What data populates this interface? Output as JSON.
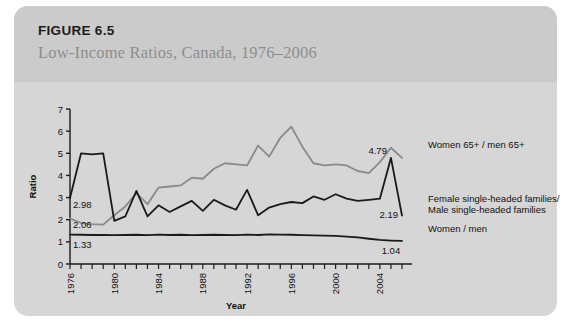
{
  "figure": {
    "number": "FIGURE 6.5",
    "subtitle": "Low-Income Ratios, Canada, 1976–2006"
  },
  "legend": {
    "women65": "Women 65+ / men 65+",
    "female_single_line1": "Female single-headed families/",
    "female_single_line2": "Male single-headed families",
    "women_men": "Women / men"
  },
  "annotations": {
    "black_start": "2.98",
    "grey_start": "2.06",
    "flat_start": "1.33",
    "grey_end": "4.79",
    "black_end": "2.19",
    "flat_end": "1.04"
  },
  "colors": {
    "panel": "#d6d6d6",
    "header": "#cbcbcb",
    "axis": "#1c1c1c",
    "series_grey": "#8a8a8a",
    "series_black": "#1a1a1a",
    "subtitle": "#8e8e8e"
  },
  "chart_data": {
    "type": "line",
    "title": "Low-Income Ratios, Canada, 1976–2006",
    "xlabel": "Year",
    "ylabel": "Ratio",
    "ylim": [
      0,
      7
    ],
    "yticks": [
      0,
      1,
      2,
      3,
      4,
      5,
      6,
      7
    ],
    "xlim": [
      1976,
      2006
    ],
    "xticks": [
      1976,
      1977,
      1978,
      1979,
      1980,
      1981,
      1982,
      1983,
      1984,
      1985,
      1986,
      1987,
      1988,
      1989,
      1990,
      1991,
      1992,
      1993,
      1994,
      1995,
      1996,
      1997,
      1998,
      1999,
      2000,
      2001,
      2002,
      2003,
      2004,
      2005,
      2006
    ],
    "xtick_labels": [
      1976,
      1980,
      1984,
      1988,
      1992,
      1996,
      2000,
      2004
    ],
    "grid": false,
    "legend_position": "right",
    "x": [
      1976,
      1977,
      1978,
      1979,
      1980,
      1981,
      1982,
      1983,
      1984,
      1985,
      1986,
      1987,
      1988,
      1989,
      1990,
      1991,
      1992,
      1993,
      1994,
      1995,
      1996,
      1997,
      1998,
      1999,
      2000,
      2001,
      2002,
      2003,
      2004,
      2005,
      2006
    ],
    "series": [
      {
        "name": "Women 65+ / men 65+",
        "color": "#8a8a8a",
        "values": [
          2.06,
          1.85,
          1.8,
          1.78,
          2.2,
          2.6,
          3.2,
          2.7,
          3.45,
          3.5,
          3.55,
          3.9,
          3.85,
          4.3,
          4.55,
          4.5,
          4.45,
          5.35,
          4.85,
          5.7,
          6.2,
          5.3,
          4.55,
          4.45,
          4.5,
          4.45,
          4.2,
          4.1,
          4.6,
          5.25,
          4.79
        ],
        "start_label": "2.06",
        "end_label": "4.79"
      },
      {
        "name": "Female single-headed families/Male single-headed families",
        "color": "#1a1a1a",
        "values": [
          2.98,
          5.0,
          4.95,
          5.0,
          1.95,
          2.15,
          3.3,
          2.15,
          2.65,
          2.35,
          2.6,
          2.85,
          2.4,
          2.9,
          2.65,
          2.45,
          3.35,
          2.2,
          2.55,
          2.7,
          2.8,
          2.75,
          3.05,
          2.9,
          3.15,
          2.95,
          2.85,
          2.9,
          2.95,
          4.79,
          2.19
        ],
        "start_label": "2.98",
        "end_label": "2.19"
      },
      {
        "name": "Women / men",
        "color": "#1a1a1a",
        "values": [
          1.33,
          1.32,
          1.31,
          1.31,
          1.3,
          1.31,
          1.32,
          1.3,
          1.33,
          1.31,
          1.32,
          1.3,
          1.31,
          1.32,
          1.31,
          1.3,
          1.33,
          1.31,
          1.34,
          1.33,
          1.32,
          1.3,
          1.29,
          1.28,
          1.27,
          1.24,
          1.2,
          1.14,
          1.09,
          1.06,
          1.04
        ],
        "start_label": "1.33",
        "end_label": "1.04"
      }
    ]
  }
}
